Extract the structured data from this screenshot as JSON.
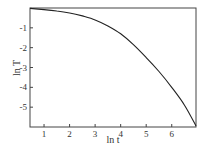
{
  "chart_data": {
    "type": "line",
    "title": "",
    "xlabel": "ln t",
    "ylabel": "ln T",
    "xlim": [
      0.45,
      6.95
    ],
    "ylim": [
      -6.0,
      0.0
    ],
    "xticks": [
      1,
      2,
      3,
      4,
      5,
      6
    ],
    "yticks": [
      -1,
      -2,
      -3,
      -4,
      -5
    ],
    "xtick_labels": [
      "1",
      "2",
      "3",
      "4",
      "5",
      "6"
    ],
    "ytick_labels": [
      "-1",
      "-2",
      "-3",
      "-4",
      "-5"
    ],
    "grid": false,
    "legend": null,
    "series": [
      {
        "name": "ln T vs ln t",
        "x": [
          0.45,
          1.0,
          1.5,
          2.0,
          2.5,
          3.0,
          3.5,
          4.0,
          4.5,
          5.0,
          5.5,
          6.0,
          6.5,
          6.95
        ],
        "y": [
          -0.02,
          -0.08,
          -0.15,
          -0.25,
          -0.4,
          -0.6,
          -0.9,
          -1.3,
          -1.85,
          -2.5,
          -3.2,
          -4.0,
          -4.9,
          -5.95
        ]
      }
    ]
  }
}
